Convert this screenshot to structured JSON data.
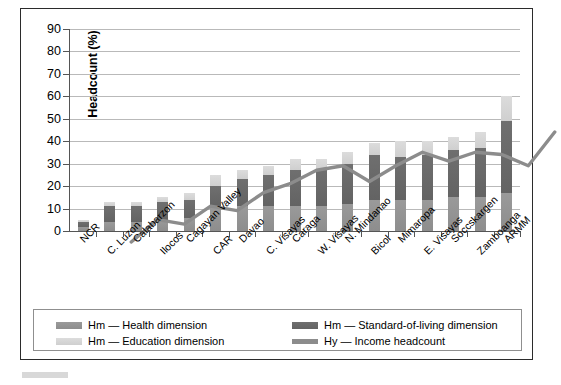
{
  "figure": {
    "y_axis_title": "Headcount (%)"
  },
  "legend": {
    "items": [
      {
        "id": "health",
        "swatch": "bar-swatch",
        "label": "Hm — Health dimension"
      },
      {
        "id": "sol",
        "swatch": "bar-swatch",
        "label": "Hm — Standard-of-living dimension"
      },
      {
        "id": "education",
        "swatch": "bar-swatch",
        "label": "Hm — Education dimension"
      },
      {
        "id": "income",
        "swatch": "line-swatch",
        "label": "Hy — Income headcount"
      }
    ]
  },
  "colors": {
    "health": "#949494",
    "standard_of_living": "#696969",
    "education": "#d6d6d6",
    "income_line": "#8c8c8c",
    "gridline": "#b9b9b9",
    "axis": "#555555",
    "frame": "#2b2b2b"
  },
  "chart_data": {
    "type": "bar",
    "title": "",
    "xlabel": "",
    "ylabel": "Headcount (%)",
    "ylim": [
      0,
      90
    ],
    "yticks": [
      0,
      10,
      20,
      30,
      40,
      50,
      60,
      70,
      80,
      90
    ],
    "grid": true,
    "stacked": true,
    "legend_position": "bottom",
    "categories": [
      "NCR",
      "C. Luzon",
      "Calabarzon",
      "Ilocos",
      "Cagayan Valley",
      "CAR",
      "Davao",
      "C. Visayas",
      "Caraga",
      "W. Visayas",
      "N. Mindanao",
      "Bicol",
      "Mimaropa",
      "E. Visayas",
      "Soccskargen",
      "Zamboanga",
      "ARMM"
    ],
    "series": [
      {
        "name": "Hm — Health dimension",
        "type": "bar-segment",
        "values": [
          2,
          4,
          4,
          5,
          6,
          11,
          11,
          11,
          11,
          11,
          12,
          14,
          14,
          14,
          15,
          15,
          17
        ]
      },
      {
        "name": "Hm — Standard-of-living dimension",
        "type": "bar-segment",
        "values": [
          2,
          7,
          7,
          8,
          8,
          9,
          12,
          14,
          16,
          16,
          18,
          20,
          19,
          20,
          21,
          22,
          32
        ]
      },
      {
        "name": "Hm — Education dimension",
        "type": "bar-segment",
        "values": [
          1,
          2,
          2,
          2,
          3,
          5,
          4,
          4,
          5,
          5,
          5,
          5,
          7,
          6,
          6,
          7,
          11
        ]
      },
      {
        "name": "Hy — Income headcount",
        "type": "line",
        "values": [
          4,
          14,
          12,
          20,
          18,
          26,
          30,
          36,
          38,
          31,
          38,
          44,
          40,
          44,
          43,
          38,
          53
        ]
      }
    ],
    "stacked_totals": [
      5,
      13,
      13,
      15,
      17,
      25,
      27,
      29,
      32,
      32,
      35,
      39,
      40,
      40,
      42,
      44,
      80
    ]
  }
}
